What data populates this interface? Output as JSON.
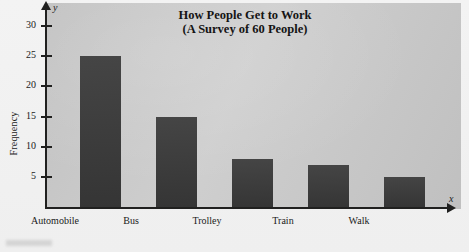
{
  "chart_data": {
    "type": "bar",
    "title": "How People Get to Work",
    "subtitle": "(A Survey of 60 People)",
    "categories": [
      "Automobile",
      "Bus",
      "Trolley",
      "Train",
      "Walk"
    ],
    "values": [
      25,
      15,
      8,
      7,
      5
    ],
    "xlabel": "",
    "ylabel": "Frequency",
    "ylim": [
      0,
      33
    ],
    "yticks": [
      5,
      10,
      15,
      20,
      25,
      30
    ],
    "ytick_labels": [
      "5",
      "10",
      "15",
      "20",
      "25",
      "30"
    ],
    "grid": false,
    "legend": null,
    "axis_symbols": {
      "x": "x",
      "y": "y"
    },
    "colors": {
      "bar": "#3b3b3b",
      "plot_background": "#cccccc",
      "axis": "#20201f",
      "page": "#f2f2f2"
    }
  }
}
